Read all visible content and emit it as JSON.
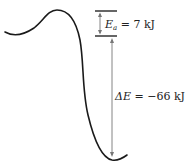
{
  "diagram": {
    "type": "energy-profile",
    "activation_energy": {
      "symbol": "E",
      "subscript": "a",
      "equals": " = ",
      "value": "7 kJ",
      "value_kj": 7
    },
    "energy_change": {
      "symbol": "ΔE",
      "equals": " = ",
      "value": "−66 kJ",
      "value_kj": -66
    },
    "colors": {
      "curve": "#1a1a1a",
      "level_lines": "#555555",
      "dimension_arrows": "#777777",
      "text": "#222222",
      "background": "#ffffff"
    }
  }
}
